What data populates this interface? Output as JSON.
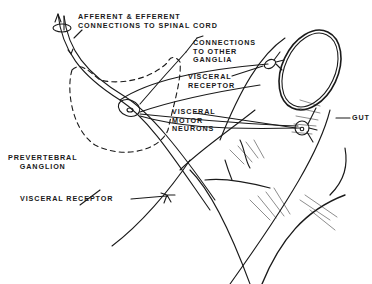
{
  "diagram": {
    "type": "anatomical illustration",
    "colors": {
      "ink": "#1a1a1a",
      "background": "#ffffff"
    },
    "labels": {
      "afferent_efferent": "AFFERENT & EFFERENT\nCONNECTIONS TO SPINAL CORD",
      "connections_other_ganglia": "CONNECTIONS\nTO OTHER\nGANGLIA",
      "visceral_receptor_top": "VISCERAL\nRECEPTOR",
      "visceral_motor_neurons": "VISCERAL\nMOTOR\nNEURONS",
      "gut": "GUT",
      "prevertebral_ganglion": "PREVERTEBRAL\nGANGLION",
      "visceral_receptor_bottom": "VISCERAL RECEPTOR"
    }
  }
}
